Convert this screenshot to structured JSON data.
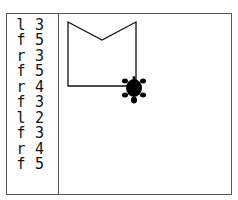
{
  "program": {
    "commands": [
      {
        "op": "l",
        "arg": "3"
      },
      {
        "op": "f",
        "arg": "5"
      },
      {
        "op": "r",
        "arg": "3"
      },
      {
        "op": "f",
        "arg": "5"
      },
      {
        "op": "r",
        "arg": "4"
      },
      {
        "op": "f",
        "arg": "3"
      },
      {
        "op": "l",
        "arg": "2"
      },
      {
        "op": "f",
        "arg": "3"
      },
      {
        "op": "r",
        "arg": "4"
      },
      {
        "op": "f",
        "arg": "5"
      }
    ]
  },
  "canvas": {
    "path_points": [
      [
        136,
        86
      ],
      [
        68,
        86
      ],
      [
        68,
        22
      ],
      [
        102,
        40
      ],
      [
        136,
        22
      ],
      [
        136,
        86
      ]
    ],
    "turtle": {
      "x": 134,
      "y": 88,
      "heading": "down"
    },
    "line_color": "#111111",
    "turtle_color": "#000000"
  }
}
